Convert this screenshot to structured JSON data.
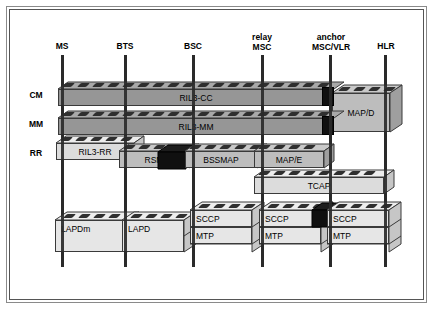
{
  "diagram": {
    "background_color": "#ffffff",
    "frame_color": "#555555",
    "row_labels": [
      {
        "id": "cm",
        "label": "CM"
      },
      {
        "id": "mm",
        "label": "MM"
      },
      {
        "id": "rr",
        "label": "RR"
      }
    ],
    "columns": [
      {
        "id": "ms",
        "label": "MS",
        "line1": "MS",
        "line2": "",
        "x": 62
      },
      {
        "id": "bts",
        "label": "BTS",
        "line1": "BTS",
        "line2": "",
        "x": 125
      },
      {
        "id": "bsc",
        "label": "BSC",
        "line1": "BSC",
        "line2": "",
        "x": 193
      },
      {
        "id": "relay-msc",
        "label": "relay MSC",
        "line1": "relay",
        "line2": "MSC",
        "x": 262
      },
      {
        "id": "anchor-msc",
        "label": "anchor MSC/VLR",
        "line1": "anchor",
        "line2": "MSC/VLR",
        "x": 330
      },
      {
        "id": "hlr",
        "label": "HLR",
        "line1": "HLR",
        "line2": "",
        "x": 385
      }
    ],
    "blocks": [
      {
        "id": "ril3-cc",
        "label": "RIL3-CC",
        "row": "CM",
        "from": "ms",
        "to": "anchor-msc",
        "shade": "dark",
        "align": "center"
      },
      {
        "id": "ril3-mm",
        "label": "RIL3-MM",
        "row": "MM",
        "from": "ms",
        "to": "anchor-msc",
        "shade": "dark",
        "align": "center"
      },
      {
        "id": "map-d",
        "label": "MAP/D",
        "row": "CM-MM",
        "from": "anchor-msc",
        "to": "hlr",
        "shade": "mid",
        "align": "center"
      },
      {
        "id": "ril3-rr",
        "label": "RIL3-RR",
        "row": "RR",
        "from": "ms",
        "to": "bts",
        "shade": "light",
        "align": "center"
      },
      {
        "id": "rsm",
        "label": "RSM",
        "row": "RR",
        "from": "bts",
        "to": "bsc",
        "shade": "mid",
        "align": "center"
      },
      {
        "id": "bssmap",
        "label": "BSSMAP",
        "row": "RR",
        "from": "bsc",
        "to": "relay-msc",
        "shade": "mid",
        "align": "center"
      },
      {
        "id": "map-e",
        "label": "MAP/E",
        "row": "RR",
        "from": "relay-msc",
        "to": "anchor-msc",
        "shade": "mid",
        "align": "center"
      },
      {
        "id": "tcap",
        "label": "TCAP",
        "row": "TCAP",
        "from": "relay-msc",
        "to": "hlr",
        "shade": "light",
        "align": "center"
      },
      {
        "id": "lapdm",
        "label": "LAPDm",
        "row": "LOWER",
        "from": "ms",
        "to": "bts",
        "shade": "light",
        "align": "left"
      },
      {
        "id": "lapd",
        "label": "LAPD",
        "row": "LOWER",
        "from": "bts",
        "to": "bsc",
        "shade": "light",
        "align": "left"
      },
      {
        "id": "sccp-bsc",
        "label": "SCCP",
        "row": "SCCP",
        "from": "bsc",
        "to": "relay-msc",
        "shade": "light",
        "align": "left"
      },
      {
        "id": "mtp-bsc",
        "label": "MTP",
        "row": "MTP",
        "from": "bsc",
        "to": "relay-msc",
        "shade": "light",
        "align": "left"
      },
      {
        "id": "sccp-relay",
        "label": "SCCP",
        "row": "SCCP",
        "from": "relay-msc",
        "to": "anchor-msc",
        "shade": "light",
        "align": "left"
      },
      {
        "id": "mtp-relay",
        "label": "MTP",
        "row": "MTP",
        "from": "relay-msc",
        "to": "anchor-msc",
        "shade": "light",
        "align": "left"
      },
      {
        "id": "sccp-anchor",
        "label": "SCCP",
        "row": "SCCP",
        "from": "anchor-msc",
        "to": "hlr",
        "shade": "light",
        "align": "left"
      },
      {
        "id": "mtp-anchor",
        "label": "MTP",
        "row": "MTP",
        "from": "anchor-msc",
        "to": "hlr",
        "shade": "light",
        "align": "left"
      }
    ],
    "connectors": [
      {
        "id": "conn-cc-anchor",
        "at": "anchor-msc",
        "row": "CM"
      },
      {
        "id": "conn-mm-anchor",
        "at": "anchor-msc",
        "row": "MM"
      },
      {
        "id": "conn-rsm-bssmap",
        "at": "bsc",
        "row": "RR"
      },
      {
        "id": "conn-sccp-anchor",
        "at": "anchor-msc",
        "row": "SCCP"
      }
    ],
    "colors": {
      "brick_dark_face": "#969696",
      "brick_dark_top": "#a8a8a8",
      "brick_mid_face": "#bdbdbd",
      "brick_mid_top": "#c9c9c9",
      "brick_light_face": "#e2e2e2",
      "brick_light_top": "#ededed",
      "connector": "#101010",
      "column_line": "#2a2a2a",
      "text": "#000000"
    }
  }
}
